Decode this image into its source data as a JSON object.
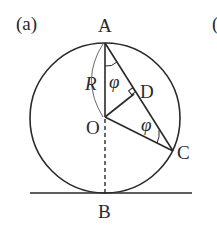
{
  "figure": {
    "panel_label": "(a)",
    "next_panel_partial": "(",
    "points": {
      "A": "A",
      "B": "B",
      "O": "O",
      "C": "C",
      "D": "D"
    },
    "radius_label": "R",
    "angle_label_1": "φ",
    "angle_label_2": "φ"
  }
}
